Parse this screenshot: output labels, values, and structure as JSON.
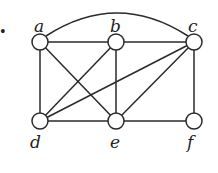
{
  "diagram": {
    "type": "graph",
    "bullet": "•",
    "nodes": [
      {
        "id": "a",
        "label": "a",
        "x": 40,
        "y": 42
      },
      {
        "id": "b",
        "label": "b",
        "x": 116,
        "y": 42
      },
      {
        "id": "c",
        "label": "c",
        "x": 194,
        "y": 42
      },
      {
        "id": "d",
        "label": "d",
        "x": 40,
        "y": 121
      },
      {
        "id": "e",
        "label": "e",
        "x": 116,
        "y": 121
      },
      {
        "id": "f",
        "label": "f",
        "x": 194,
        "y": 121
      }
    ],
    "edges": [
      [
        "a",
        "b"
      ],
      [
        "b",
        "c"
      ],
      [
        "a",
        "c"
      ],
      [
        "a",
        "d"
      ],
      [
        "a",
        "e"
      ],
      [
        "b",
        "d"
      ],
      [
        "b",
        "e"
      ],
      [
        "c",
        "d"
      ],
      [
        "c",
        "e"
      ],
      [
        "c",
        "f"
      ],
      [
        "d",
        "e"
      ],
      [
        "e",
        "f"
      ]
    ]
  }
}
